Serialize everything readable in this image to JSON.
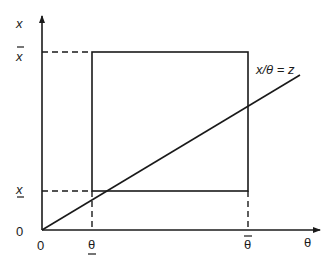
{
  "diagram": {
    "type": "constraint-region-diagram",
    "colors": {
      "stroke": "#1a1a1a",
      "background": "#ffffff"
    },
    "axes": {
      "y_label": "x",
      "x_label": "θ",
      "y_origin_label": "0",
      "x_origin_label": "0"
    },
    "y_ticks": {
      "upper": {
        "label": "x",
        "decoration": "overbar"
      },
      "lower": {
        "label": "x",
        "decoration": "underbar"
      }
    },
    "x_ticks": {
      "lower": {
        "label": "θ",
        "decoration": "underbar"
      },
      "upper": {
        "label": "θ",
        "decoration": "overbar"
      }
    },
    "rectangle": {
      "description": "feasible region bounded by lower/upper x and lower/upper θ"
    },
    "ray": {
      "label": "x/θ = z"
    }
  }
}
